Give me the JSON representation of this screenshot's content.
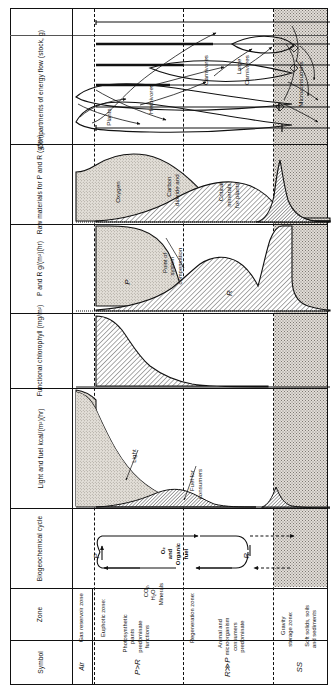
{
  "figure": {
    "type": "diagram-table"
  },
  "row_labels": [
    {
      "id": "compartments",
      "text": "Compartments of\nenergy flow\n(stock, g)"
    },
    {
      "id": "raw-materials",
      "text": "Raw materials\nfor P and R\n(g/m³)"
    },
    {
      "id": "p-and-r",
      "text": "P and R\ng/(m²)(hr)"
    },
    {
      "id": "chlorophyll",
      "text": "Functional\nchlorophyll\n(mg/m²)"
    },
    {
      "id": "light-fuel",
      "text": "Light and fuel\nkcal/(m²)(hr)"
    },
    {
      "id": "biogeochemical",
      "text": "Biogeochemical\ncycle"
    },
    {
      "id": "zone",
      "text": "Zone"
    },
    {
      "id": "symbol",
      "text": "Symbol"
    }
  ],
  "compartments": {
    "labels": [
      {
        "id": "plants",
        "text": "Plants"
      },
      {
        "id": "herbivores",
        "text": "Herbivores"
      },
      {
        "id": "carnivores",
        "text": "Carnivores"
      },
      {
        "id": "large-carnivores",
        "text": "Large\nCarnivores"
      },
      {
        "id": "microconsumers",
        "text": "Microconsumers"
      }
    ]
  },
  "raw_materials": {
    "labels": [
      {
        "id": "oxygen",
        "text": "Oxygen"
      },
      {
        "id": "carbon-dioxide",
        "text": "Carbon\ndioxide and"
      },
      {
        "id": "critical-minerals",
        "text": "Critical\nminerals\nfor plants"
      }
    ]
  },
  "p_and_r": {
    "labels": [
      {
        "id": "p-curve",
        "text": "P"
      },
      {
        "id": "r-curve",
        "text": "R"
      },
      {
        "id": "compensation-point",
        "text": "Point of\nsystem\ncompensation"
      }
    ]
  },
  "light_fuel": {
    "labels": [
      {
        "id": "light",
        "text": "Light"
      },
      {
        "id": "fuel-consumers",
        "text": "Fuel for\nconsumers"
      }
    ]
  },
  "biogeochemical": {
    "labels": [
      {
        "id": "p-node",
        "text": "P"
      },
      {
        "id": "r-node",
        "text": "R"
      },
      {
        "id": "products",
        "text": "O₂\nand\nOrganic\nfuel"
      },
      {
        "id": "reactants",
        "text": "CO₂,\nH₂O,\nMinerals"
      }
    ]
  },
  "zones": [
    {
      "id": "gas-reservoir",
      "name": "Gas reservoir zone",
      "detail": "",
      "symbol": "Air"
    },
    {
      "id": "euphotic",
      "name": "Euphotic zone:",
      "detail": "Photosynthetic\nplants\npredominate\nfunctions",
      "symbol": "P>R"
    },
    {
      "id": "regeneration",
      "name": "Regeneration zone:",
      "detail": "Animal and\nmicroorganism\nconsumers\npredominate",
      "symbol": "R≫P"
    },
    {
      "id": "gravity-storage",
      "name": "Gravity\nstorage zone:",
      "detail": "Soft solids, soils\nand sediments",
      "symbol": "SS"
    }
  ],
  "colors": {
    "ink": "#111111",
    "stipple": "#ded9d2",
    "shade": "#e6e2dc"
  }
}
